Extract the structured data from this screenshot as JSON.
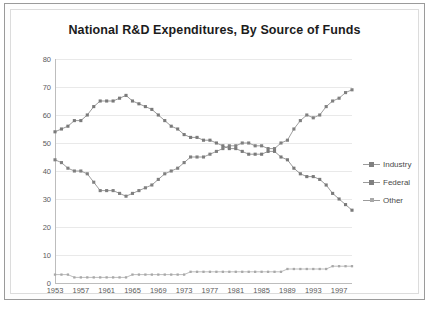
{
  "chart_data": {
    "type": "line",
    "title": "National R&D Expenditures, By Source of Funds",
    "xlabel": "",
    "ylabel": "",
    "ylim": [
      0,
      80
    ],
    "ytick_step": 10,
    "yticks": [
      0,
      10,
      20,
      30,
      40,
      50,
      60,
      70,
      80
    ],
    "xlim": [
      1953,
      1999
    ],
    "xticks": [
      1953,
      1957,
      1961,
      1965,
      1969,
      1973,
      1977,
      1981,
      1985,
      1989,
      1993,
      1997
    ],
    "grid": true,
    "grid_orientation": "horizontal",
    "legend_position": "right",
    "marker": "square",
    "x": [
      1953,
      1954,
      1955,
      1956,
      1957,
      1958,
      1959,
      1960,
      1961,
      1962,
      1963,
      1964,
      1965,
      1966,
      1967,
      1968,
      1969,
      1970,
      1971,
      1972,
      1973,
      1974,
      1975,
      1976,
      1977,
      1978,
      1979,
      1980,
      1981,
      1982,
      1983,
      1984,
      1985,
      1986,
      1987,
      1988,
      1989,
      1990,
      1991,
      1992,
      1993,
      1994,
      1995,
      1996,
      1997,
      1998,
      1999
    ],
    "series": [
      {
        "name": "Industry",
        "color": "#808080",
        "values": [
          44,
          43,
          41,
          40,
          40,
          39,
          36,
          33,
          33,
          33,
          32,
          31,
          32,
          33,
          34,
          35,
          37,
          39,
          40,
          41,
          43,
          45,
          45,
          45,
          46,
          47,
          48,
          49,
          49,
          50,
          50,
          49,
          49,
          48,
          48,
          50,
          51,
          55,
          58,
          60,
          59,
          60,
          63,
          65,
          66,
          68,
          69
        ]
      },
      {
        "name": "Federal",
        "color": "#7a7a7a",
        "values": [
          54,
          55,
          56,
          58,
          58,
          60,
          63,
          65,
          65,
          65,
          66,
          67,
          65,
          64,
          63,
          62,
          60,
          58,
          56,
          55,
          53,
          52,
          52,
          51,
          51,
          50,
          49,
          48,
          48,
          47,
          46,
          46,
          46,
          47,
          47,
          45,
          44,
          41,
          39,
          38,
          38,
          37,
          35,
          32,
          30,
          28,
          26
        ]
      },
      {
        "name": "Other",
        "color": "#a8a8a8",
        "values": [
          3,
          3,
          3,
          2,
          2,
          2,
          2,
          2,
          2,
          2,
          2,
          2,
          3,
          3,
          3,
          3,
          3,
          3,
          3,
          3,
          3,
          4,
          4,
          4,
          4,
          4,
          4,
          4,
          4,
          4,
          4,
          4,
          4,
          4,
          4,
          4,
          5,
          5,
          5,
          5,
          5,
          5,
          5,
          6,
          6,
          6,
          6
        ]
      }
    ]
  },
  "legend": {
    "items": [
      {
        "label": "Industry",
        "icon": "square-marker-icon"
      },
      {
        "label": "Federal",
        "icon": "square-marker-icon"
      },
      {
        "label": "Other",
        "icon": "dot-marker-icon"
      }
    ]
  }
}
